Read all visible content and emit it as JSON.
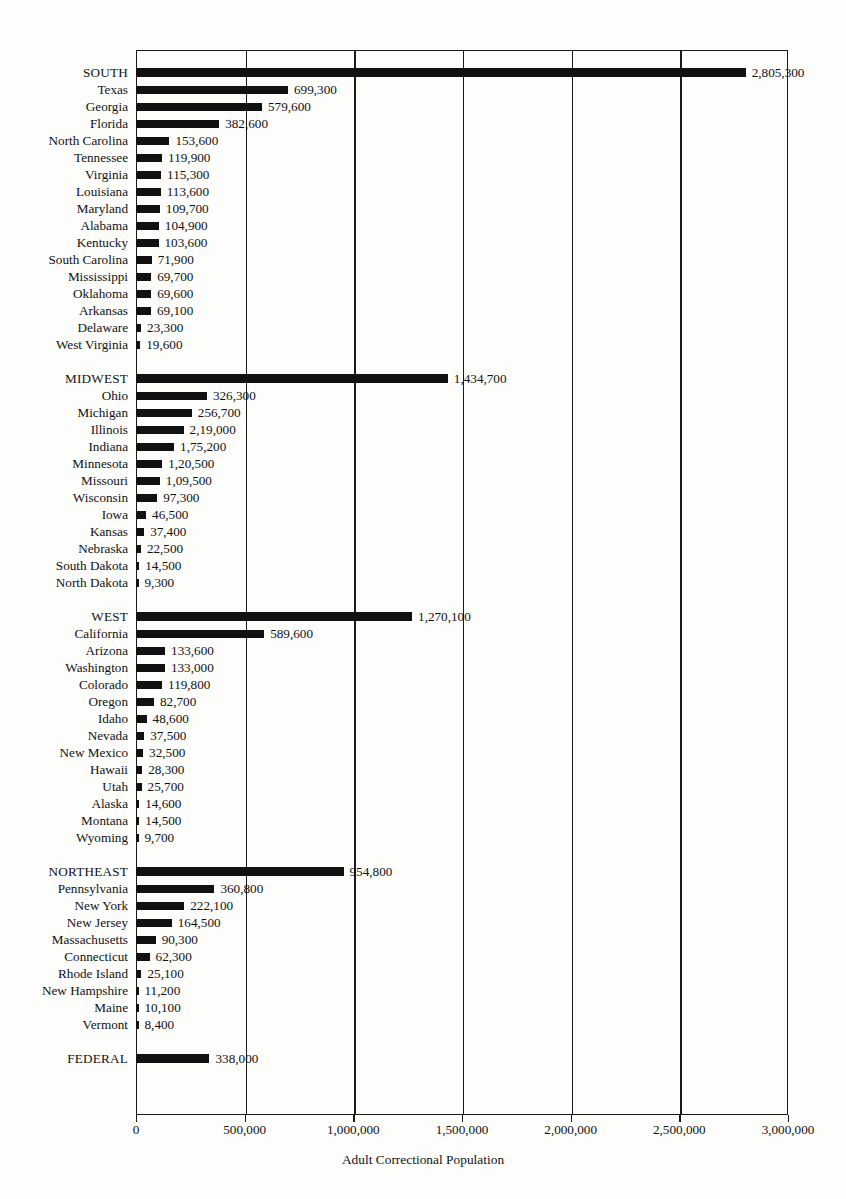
{
  "chart_data": {
    "type": "bar",
    "orientation": "horizontal",
    "title": "",
    "xlabel": "Adult Correctional Population",
    "ylabel": "",
    "xlim": [
      0,
      3000000
    ],
    "grid": true,
    "legend": "none",
    "tick_labels": [
      "0",
      "500,000",
      "1,000,000",
      "1,500,000",
      "2,000,000",
      "2,500,000",
      "3,000,000"
    ],
    "tick_values": [
      0,
      500000,
      1000000,
      1500000,
      2000000,
      2500000,
      3000000
    ],
    "groups": [
      {
        "name": "SOUTH",
        "rows": [
          {
            "label": "SOUTH",
            "value": 2805300,
            "display": "2,805,300",
            "is_region": true
          },
          {
            "label": "Texas",
            "value": 699300,
            "display": "699,300",
            "is_region": false
          },
          {
            "label": "Georgia",
            "value": 579600,
            "display": "579,600",
            "is_region": false
          },
          {
            "label": "Florida",
            "value": 382600,
            "display": "382,600",
            "is_region": false
          },
          {
            "label": "North Carolina",
            "value": 153600,
            "display": "153,600",
            "is_region": false
          },
          {
            "label": "Tennessee",
            "value": 119900,
            "display": "119,900",
            "is_region": false
          },
          {
            "label": "Virginia",
            "value": 115300,
            "display": "115,300",
            "is_region": false
          },
          {
            "label": "Louisiana",
            "value": 113600,
            "display": "113,600",
            "is_region": false
          },
          {
            "label": "Maryland",
            "value": 109700,
            "display": "109,700",
            "is_region": false
          },
          {
            "label": "Alabama",
            "value": 104900,
            "display": "104,900",
            "is_region": false
          },
          {
            "label": "Kentucky",
            "value": 103600,
            "display": "103,600",
            "is_region": false
          },
          {
            "label": "South Carolina",
            "value": 71900,
            "display": "71,900",
            "is_region": false
          },
          {
            "label": "Mississippi",
            "value": 69700,
            "display": "69,700",
            "is_region": false
          },
          {
            "label": "Oklahoma",
            "value": 69600,
            "display": "69,600",
            "is_region": false
          },
          {
            "label": "Arkansas",
            "value": 69100,
            "display": "69,100",
            "is_region": false
          },
          {
            "label": "Delaware",
            "value": 23300,
            "display": "23,300",
            "is_region": false
          },
          {
            "label": "West Virginia",
            "value": 19600,
            "display": "19,600",
            "is_region": false
          }
        ]
      },
      {
        "name": "MIDWEST",
        "rows": [
          {
            "label": "MIDWEST",
            "value": 1434700,
            "display": "1,434,700",
            "is_region": true
          },
          {
            "label": "Ohio",
            "value": 326300,
            "display": "326,300",
            "is_region": false
          },
          {
            "label": "Michigan",
            "value": 256700,
            "display": "256,700",
            "is_region": false
          },
          {
            "label": "Illinois",
            "value": 219000,
            "display": "2,19,000",
            "is_region": false
          },
          {
            "label": "Indiana",
            "value": 175200,
            "display": "1,75,200",
            "is_region": false
          },
          {
            "label": "Minnesota",
            "value": 120500,
            "display": "1,20,500",
            "is_region": false
          },
          {
            "label": "Missouri",
            "value": 109500,
            "display": "1,09,500",
            "is_region": false
          },
          {
            "label": "Wisconsin",
            "value": 97300,
            "display": "97,300",
            "is_region": false
          },
          {
            "label": "Iowa",
            "value": 46500,
            "display": "46,500",
            "is_region": false
          },
          {
            "label": "Kansas",
            "value": 37400,
            "display": "37,400",
            "is_region": false
          },
          {
            "label": "Nebraska",
            "value": 22500,
            "display": "22,500",
            "is_region": false
          },
          {
            "label": "South Dakota",
            "value": 14500,
            "display": "14,500",
            "is_region": false
          },
          {
            "label": "North Dakota",
            "value": 9300,
            "display": "9,300",
            "is_region": false
          }
        ]
      },
      {
        "name": "WEST",
        "rows": [
          {
            "label": "WEST",
            "value": 1270100,
            "display": "1,270,100",
            "is_region": true
          },
          {
            "label": "California",
            "value": 589600,
            "display": "589,600",
            "is_region": false
          },
          {
            "label": "Arizona",
            "value": 133600,
            "display": "133,600",
            "is_region": false
          },
          {
            "label": "Washington",
            "value": 133000,
            "display": "133,000",
            "is_region": false
          },
          {
            "label": "Colorado",
            "value": 119800,
            "display": "119,800",
            "is_region": false
          },
          {
            "label": "Oregon",
            "value": 82700,
            "display": "82,700",
            "is_region": false
          },
          {
            "label": "Idaho",
            "value": 48600,
            "display": "48,600",
            "is_region": false
          },
          {
            "label": "Nevada",
            "value": 37500,
            "display": "37,500",
            "is_region": false
          },
          {
            "label": "New Mexico",
            "value": 32500,
            "display": "32,500",
            "is_region": false
          },
          {
            "label": "Hawaii",
            "value": 28300,
            "display": "28,300",
            "is_region": false
          },
          {
            "label": "Utah",
            "value": 25700,
            "display": "25,700",
            "is_region": false
          },
          {
            "label": "Alaska",
            "value": 14600,
            "display": "14,600",
            "is_region": false
          },
          {
            "label": "Montana",
            "value": 14500,
            "display": "14,500",
            "is_region": false
          },
          {
            "label": "Wyoming",
            "value": 9700,
            "display": "9,700",
            "is_region": false
          }
        ]
      },
      {
        "name": "NORTHEAST",
        "rows": [
          {
            "label": "NORTHEAST",
            "value": 954800,
            "display": "954,800",
            "is_region": true
          },
          {
            "label": "Pennsylvania",
            "value": 360800,
            "display": "360,800",
            "is_region": false
          },
          {
            "label": "New York",
            "value": 222100,
            "display": "222,100",
            "is_region": false
          },
          {
            "label": "New Jersey",
            "value": 164500,
            "display": "164,500",
            "is_region": false
          },
          {
            "label": "Massachusetts",
            "value": 90300,
            "display": "90,300",
            "is_region": false
          },
          {
            "label": "Connecticut",
            "value": 62300,
            "display": "62,300",
            "is_region": false
          },
          {
            "label": "Rhode Island",
            "value": 25100,
            "display": "25,100",
            "is_region": false
          },
          {
            "label": "New Hampshire",
            "value": 11200,
            "display": "11,200",
            "is_region": false
          },
          {
            "label": "Maine",
            "value": 10100,
            "display": "10,100",
            "is_region": false
          },
          {
            "label": "Vermont",
            "value": 8400,
            "display": "8,400",
            "is_region": false
          }
        ]
      },
      {
        "name": "FEDERAL",
        "rows": [
          {
            "label": "FEDERAL",
            "value": 338000,
            "display": "338,000",
            "is_region": true
          }
        ]
      }
    ]
  },
  "colors": {
    "bar": "#111111",
    "axis": "#1a1a1a",
    "background": "#fdfdfb",
    "text": "#111111"
  }
}
